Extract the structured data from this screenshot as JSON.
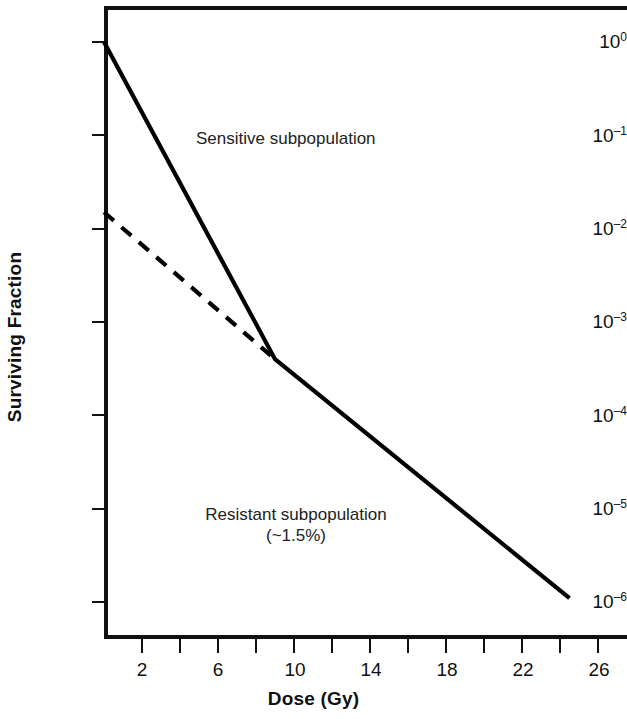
{
  "chart_data": {
    "type": "line",
    "title": "",
    "xlabel": "Dose (Gy)",
    "ylabel": "Surviving Fraction",
    "xlim": [
      0,
      27.5
    ],
    "ylim": [
      1e-06,
      1.8
    ],
    "yscale": "log",
    "grid": false,
    "legend": null,
    "x_ticks": [
      2,
      4,
      6,
      8,
      10,
      12,
      14,
      16,
      18,
      20,
      22,
      24,
      26
    ],
    "x_tick_labels": [
      "2",
      "",
      "6",
      "",
      "10",
      "",
      "14",
      "",
      "18",
      "",
      "22",
      "",
      "26"
    ],
    "y_ticks": [
      1,
      0.1,
      0.01,
      0.001,
      0.0001,
      1e-05,
      1e-06
    ],
    "y_tick_labels": [
      "10⁰",
      "10⁻¹",
      "10⁻²",
      "10⁻³",
      "10⁻⁴",
      "10⁻⁵",
      "10⁻⁶"
    ],
    "series": [
      {
        "name": "Total survival curve",
        "style": "solid",
        "color": "#000000",
        "x": [
          0,
          9.0,
          24.5
        ],
        "y": [
          1.0,
          0.0004,
          1.1e-06
        ]
      },
      {
        "name": "Resistant subpopulation component",
        "style": "dashed",
        "color": "#000000",
        "x": [
          0,
          9.0
        ],
        "y": [
          0.015,
          0.0004
        ]
      }
    ],
    "annotations": [
      {
        "text": "Sensitive subpopulation",
        "x": 10.0,
        "y": 0.075
      },
      {
        "text": "Resistant subpopulation",
        "x": 10.5,
        "y": 8.2e-06
      },
      {
        "text": "(~1.5%)",
        "x": 10.5,
        "y": 4.2e-06
      }
    ]
  },
  "axes": {
    "y_title": "Surviving Fraction",
    "x_title": "Dose (Gy)",
    "y_tick_labels": [
      {
        "mantissa": "10",
        "exponent": "0"
      },
      {
        "mantissa": "10",
        "exponent": "–1"
      },
      {
        "mantissa": "10",
        "exponent": "–2"
      },
      {
        "mantissa": "10",
        "exponent": "–3"
      },
      {
        "mantissa": "10",
        "exponent": "–4"
      },
      {
        "mantissa": "10",
        "exponent": "–5"
      },
      {
        "mantissa": "10",
        "exponent": "–6"
      }
    ],
    "x_tick_labels": [
      "2",
      "6",
      "10",
      "14",
      "18",
      "22",
      "26"
    ]
  },
  "annotations": {
    "sensitive": "Sensitive subpopulation",
    "resistant_line1": "Resistant subpopulation",
    "resistant_line2": "(~1.5%)"
  },
  "colors": {
    "background": "#ffffff",
    "axis": "#111111",
    "curve": "#000000",
    "text": "#1a1a1a"
  }
}
